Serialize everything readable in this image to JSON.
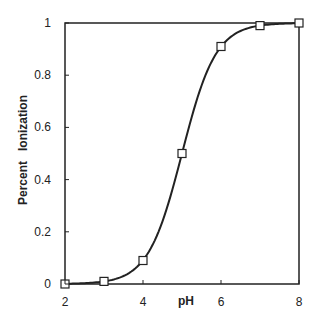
{
  "chart_data": {
    "type": "line",
    "title": "",
    "xlabel": "pH",
    "ylabel": "Percent   Ionization",
    "xlim": [
      2,
      8
    ],
    "ylim": [
      0,
      1
    ],
    "x_ticks": [
      "2",
      "4",
      "6",
      "8"
    ],
    "y_ticks": [
      "0",
      "0.2",
      "0.4",
      "0.6",
      "0.8",
      "1"
    ],
    "grid": false,
    "legend": null,
    "marker": "open-square",
    "series": [
      {
        "name": "Percent Ionization",
        "x": [
          2,
          3,
          4,
          5,
          6,
          7,
          8
        ],
        "values": [
          0.0,
          0.01,
          0.09,
          0.5,
          0.91,
          0.99,
          1.0
        ]
      }
    ]
  }
}
